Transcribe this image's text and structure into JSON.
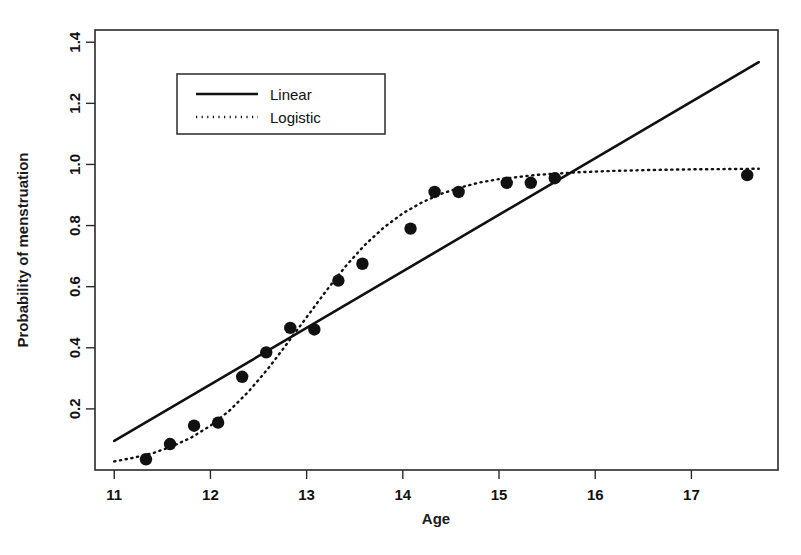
{
  "chart_data": {
    "type": "scatter",
    "title": "",
    "xlabel": "Age",
    "ylabel": "Probability of menstruation",
    "xlim": [
      10.8,
      17.9
    ],
    "ylim": [
      0.0,
      1.44
    ],
    "xticks": [
      11,
      12,
      13,
      14,
      15,
      16,
      17
    ],
    "xtick_labels": [
      "11",
      "12",
      "13",
      "14",
      "15",
      "16",
      "17"
    ],
    "yticks": [
      0.2,
      0.4,
      0.6,
      0.8,
      1.0,
      1.2,
      1.4
    ],
    "ytick_labels": [
      "0.2",
      "0.4",
      "0.6",
      "0.8",
      "1.0",
      "1.2",
      "1.4"
    ],
    "grid": false,
    "legend_position": "top-left-inside",
    "legend": [
      {
        "name": "Linear",
        "style": "solid"
      },
      {
        "name": "Logistic",
        "style": "dotted"
      }
    ],
    "points": {
      "name": "Observed proportion",
      "marker": "filled-circle",
      "x": [
        11.33,
        11.58,
        11.83,
        12.08,
        12.33,
        12.58,
        12.83,
        13.08,
        13.33,
        13.58,
        14.08,
        14.33,
        14.58,
        15.08,
        15.33,
        15.58,
        17.58
      ],
      "y": [
        0.035,
        0.085,
        0.145,
        0.155,
        0.305,
        0.385,
        0.465,
        0.46,
        0.62,
        0.675,
        0.79,
        0.91,
        0.91,
        0.94,
        0.94,
        0.955,
        0.965
      ]
    },
    "series": [
      {
        "name": "Linear",
        "style": "solid",
        "x": [
          11.0,
          17.7
        ],
        "y": [
          0.095,
          1.335
        ]
      },
      {
        "name": "Logistic",
        "style": "dotted",
        "x": [
          11.0,
          11.2,
          11.4,
          11.6,
          11.8,
          12.0,
          12.2,
          12.4,
          12.6,
          12.8,
          13.0,
          13.2,
          13.4,
          13.6,
          13.8,
          14.0,
          14.2,
          14.4,
          14.6,
          14.8,
          15.0,
          15.4,
          15.8,
          16.2,
          16.6,
          17.0,
          17.4,
          17.7
        ],
        "y": [
          0.028,
          0.04,
          0.055,
          0.077,
          0.106,
          0.145,
          0.195,
          0.258,
          0.332,
          0.415,
          0.5,
          0.585,
          0.665,
          0.735,
          0.793,
          0.84,
          0.876,
          0.904,
          0.925,
          0.941,
          0.952,
          0.966,
          0.974,
          0.979,
          0.982,
          0.984,
          0.985,
          0.986
        ]
      }
    ]
  },
  "axes": {
    "x_axis_label": "Age",
    "y_axis_label": "Probability of menstruation"
  },
  "legend": {
    "linear_label": "Linear",
    "logistic_label": "Logistic"
  }
}
